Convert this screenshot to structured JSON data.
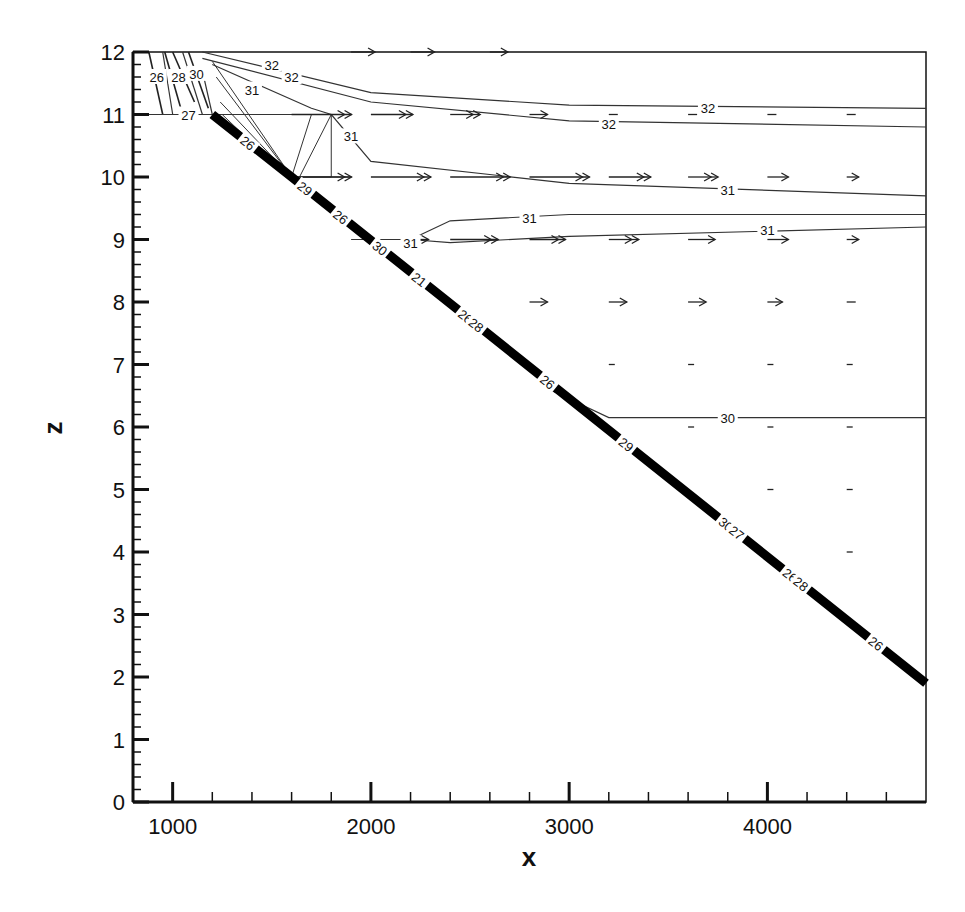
{
  "chart_data": {
    "type": "contour",
    "title": "",
    "xlabel": "x",
    "ylabel": "z",
    "xlim": [
      800,
      4800
    ],
    "ylim": [
      0,
      12
    ],
    "x_ticks": [
      1000,
      2000,
      3000,
      4000
    ],
    "x_tick_labels": [
      "1000",
      "2000",
      "3000",
      "4000"
    ],
    "x_minor_step": 200,
    "y_ticks": [
      0,
      1,
      2,
      3,
      4,
      5,
      6,
      7,
      8,
      9,
      10,
      11,
      12
    ],
    "y_tick_labels": [
      "0",
      "1",
      "2",
      "3",
      "4",
      "5",
      "6",
      "7",
      "8",
      "9",
      "10",
      "11",
      "12"
    ],
    "y_minor_step": 0.2,
    "grid": false,
    "legend": null,
    "bottom_boundary": {
      "description": "thick sloping bed line",
      "points": [
        [
          800,
          12
        ],
        [
          1200,
          11
        ],
        [
          1600,
          10
        ],
        [
          4800,
          1.9
        ]
      ]
    },
    "contour_lines": [
      {
        "level": 32,
        "points": [
          [
            1150,
            12
          ],
          [
            2000,
            11.35
          ],
          [
            3000,
            11.15
          ],
          [
            4800,
            11.1
          ]
        ],
        "labels_at": [
          [
            1500,
            11.8
          ],
          [
            1600,
            11.6
          ],
          [
            3700,
            11.1
          ]
        ]
      },
      {
        "level": 32,
        "points": [
          [
            1150,
            11.9
          ],
          [
            2000,
            11.2
          ],
          [
            3000,
            10.9
          ],
          [
            4800,
            10.8
          ]
        ],
        "labels_at": [
          [
            3200,
            10.85
          ]
        ]
      },
      {
        "level": 31,
        "points": [
          [
            1200,
            11.8
          ],
          [
            1700,
            11.1
          ],
          [
            1800,
            11.0
          ],
          [
            2000,
            10.25
          ],
          [
            3000,
            9.9
          ],
          [
            4800,
            9.7
          ]
        ],
        "labels_at": [
          [
            1400,
            11.4
          ],
          [
            1900,
            10.65
          ],
          [
            3800,
            9.8
          ]
        ]
      },
      {
        "level": 31,
        "points": [
          [
            2200,
            9.0
          ],
          [
            2400,
            9.3
          ],
          [
            3000,
            9.4
          ],
          [
            4800,
            9.4
          ]
        ],
        "labels_at": [
          [
            2800,
            9.35
          ]
        ]
      },
      {
        "level": 31,
        "points": [
          [
            1900,
            9.0
          ],
          [
            2200,
            9.0
          ],
          [
            2400,
            8.95
          ],
          [
            3000,
            9.05
          ],
          [
            4800,
            9.2
          ]
        ],
        "labels_at": [
          [
            2200,
            8.95
          ],
          [
            4000,
            9.15
          ]
        ]
      },
      {
        "level": 30,
        "points": [
          [
            2900,
            6.6
          ],
          [
            3200,
            6.15
          ],
          [
            4800,
            6.15
          ]
        ],
        "labels_at": [
          [
            3800,
            6.15
          ]
        ]
      },
      {
        "level": 30,
        "points": [
          [
            1150,
            11.7
          ],
          [
            1200,
            11.0
          ]
        ],
        "labels_at": [
          [
            1120,
            11.65
          ]
        ]
      },
      {
        "level": 28,
        "points": [
          [
            1050,
            12
          ],
          [
            1150,
            11.0
          ]
        ],
        "labels_at": [
          [
            1030,
            11.6
          ]
        ]
      },
      {
        "level": 27,
        "points": [
          [
            1000,
            11.0
          ],
          [
            1200,
            11.0
          ]
        ],
        "labels_at": [
          [
            1080,
            11.0
          ]
        ]
      },
      {
        "level": 26,
        "points": [
          [
            950,
            12
          ],
          [
            1000,
            11.0
          ]
        ],
        "labels_at": [
          [
            920,
            11.6
          ]
        ]
      }
    ],
    "contour_levels": [
      22,
      26,
      27,
      28,
      29,
      30,
      31,
      32
    ],
    "boundary_labels": [
      "26",
      "29",
      "26",
      "30",
      "21",
      "26",
      "28",
      "26",
      "29",
      "30",
      "27",
      "26",
      "28",
      "26"
    ],
    "velocity_vectors": {
      "description": "horizontal arrows (pointing +x), magnitude decreasing with depth and distance",
      "rows": [
        {
          "z": 12,
          "x": [
            1900,
            2200,
            2600
          ],
          "relative_length": [
            0.4,
            0.4,
            0.3
          ]
        },
        {
          "z": 11,
          "x": [
            1600,
            2000,
            2400,
            2800,
            3200,
            3600,
            4000,
            4400
          ],
          "relative_length": [
            1.0,
            0.7,
            0.5,
            0.3,
            0.15,
            0.15,
            0.15,
            0.15
          ]
        },
        {
          "z": 10,
          "x": [
            1600,
            2000,
            2400,
            2800,
            3200,
            3600,
            4000,
            4400
          ],
          "relative_length": [
            1.0,
            1.0,
            1.0,
            1.0,
            0.7,
            0.5,
            0.35,
            0.2
          ]
        },
        {
          "z": 9,
          "x": [
            2200,
            2400,
            2800,
            3200,
            3600,
            4000,
            4400
          ],
          "relative_length": [
            0.3,
            0.8,
            0.6,
            0.5,
            0.45,
            0.35,
            0.2
          ]
        },
        {
          "z": 8,
          "x": [
            2800,
            3200,
            3600,
            4000,
            4400
          ],
          "relative_length": [
            0.3,
            0.3,
            0.3,
            0.25,
            0.15
          ]
        },
        {
          "z": 7,
          "x": [
            3200,
            3600,
            4000,
            4400
          ],
          "relative_length": [
            0.1,
            0.1,
            0.1,
            0.1
          ]
        },
        {
          "z": 6,
          "x": [
            3600,
            4000,
            4400
          ],
          "relative_length": [
            0.05,
            0.1,
            0.1
          ]
        },
        {
          "z": 5,
          "x": [
            4000,
            4400
          ],
          "relative_length": [
            0.1,
            0.1
          ]
        },
        {
          "z": 4,
          "x": [
            4400
          ],
          "relative_length": [
            0.1
          ]
        }
      ]
    }
  },
  "axes": {
    "x_title": "x",
    "z_title": "z"
  }
}
